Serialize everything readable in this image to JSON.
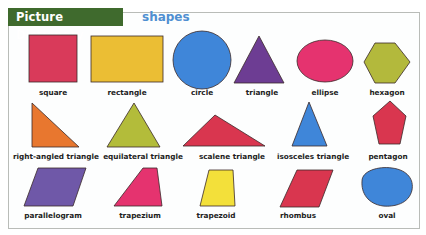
{
  "header": {
    "title": "Picture Dictionary",
    "subtitle": "shapes"
  },
  "colors": {
    "header_bg": "#3f6a2d",
    "subtitle": "#4f8fd1",
    "stroke": "#3a2a2a"
  },
  "rows": [
    {
      "items": [
        {
          "label": "square",
          "color": "#d93a5a"
        },
        {
          "label": "rectangle",
          "color": "#ebbe34"
        },
        {
          "label": "circle",
          "color": "#3f86d9"
        },
        {
          "label": "triangle",
          "color": "#6d3d93"
        },
        {
          "label": "ellipse",
          "color": "#e5336f"
        },
        {
          "label": "hexagon",
          "color": "#b3b93c"
        }
      ]
    },
    {
      "items": [
        {
          "label": "right-angled triangle",
          "color": "#e8772f"
        },
        {
          "label": "equilateral triangle",
          "color": "#b3bc3a"
        },
        {
          "label": "scalene triangle",
          "color": "#d9364f"
        },
        {
          "label": "isosceles triangle",
          "color": "#3f86d9"
        },
        {
          "label": "pentagon",
          "color": "#d9364f"
        }
      ]
    },
    {
      "items": [
        {
          "label": "parallelogram",
          "color": "#6f58a8"
        },
        {
          "label": "trapezium",
          "color": "#e5336f"
        },
        {
          "label": "trapezoid",
          "color": "#f3e03a"
        },
        {
          "label": "rhombus",
          "color": "#d9364f"
        },
        {
          "label": "oval",
          "color": "#3f86d9"
        }
      ]
    }
  ]
}
